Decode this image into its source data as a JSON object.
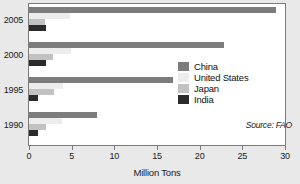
{
  "chart_data": {
    "type": "bar",
    "orientation": "horizontal",
    "title": "",
    "subtitle": "",
    "xlabel": "Million Tons",
    "ylabel": "",
    "categories": [
      "2005",
      "2000",
      "1995",
      "1990"
    ],
    "series": [
      {
        "name": "China",
        "color": "#7c7c7c",
        "values": [
          29.0,
          22.8,
          16.9,
          8.0
        ]
      },
      {
        "name": "United States",
        "color": "#ededed",
        "values": [
          4.8,
          4.9,
          4.0,
          3.9
        ]
      },
      {
        "name": "Japan",
        "color": "#c2c2c2",
        "values": [
          1.9,
          2.8,
          2.9,
          2.0
        ]
      },
      {
        "name": "India",
        "color": "#2b2b2b",
        "values": [
          2.0,
          2.0,
          1.0,
          1.0
        ]
      }
    ],
    "xlim": [
      0,
      30
    ],
    "xticks": [
      0,
      5,
      10,
      15,
      20,
      25,
      30
    ],
    "xtick_labels": [
      "0",
      "5",
      "10",
      "15",
      "20",
      "25",
      "30"
    ],
    "grid": false,
    "legend_position": "center-right",
    "legend_entries": [
      "China",
      "United States",
      "Japan",
      "India"
    ],
    "annotations": [
      "Source: FAO"
    ]
  },
  "source_note": "Source: FAO",
  "colors": {
    "background": "#e9e9e9",
    "plot_background": "#ffffff",
    "frame": "#7a7a7a",
    "text": "#1a1a1a"
  }
}
